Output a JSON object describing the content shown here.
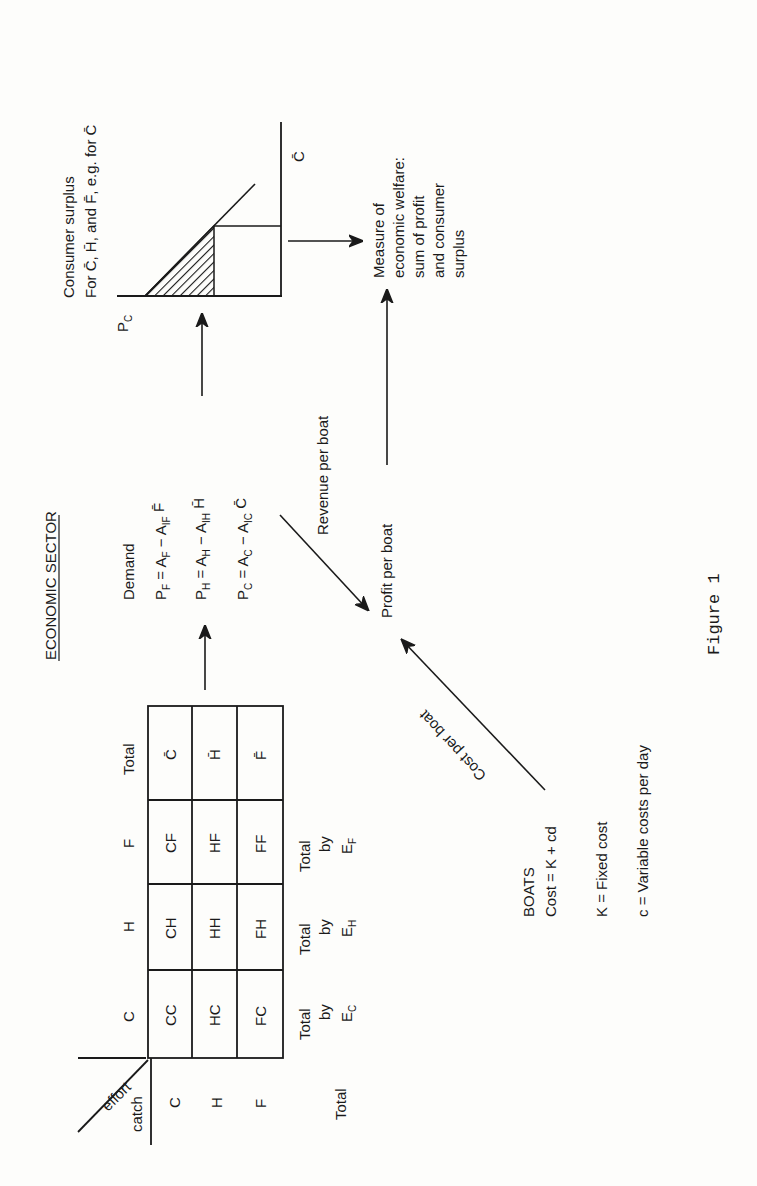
{
  "title": "ECONOMIC SECTOR",
  "figure_caption": "Figure 1",
  "matrix": {
    "corner_top": "effort",
    "corner_bottom": "catch",
    "column_headers": [
      "C",
      "H",
      "F",
      "Total"
    ],
    "row_headers": [
      "C",
      "H",
      "F"
    ],
    "cells": [
      [
        "CC",
        "CH",
        "CF",
        "C̄"
      ],
      [
        "HC",
        "HH",
        "HF",
        "H̄"
      ],
      [
        "FC",
        "FH",
        "FF",
        "F̄"
      ]
    ],
    "total_row_label": "Total",
    "effort_totals": [
      {
        "line1": "Total",
        "line2": "by",
        "sym": "E",
        "sub": "C"
      },
      {
        "line1": "Total",
        "line2": "by",
        "sym": "E",
        "sub": "H"
      },
      {
        "line1": "Total",
        "line2": "by",
        "sym": "E",
        "sub": "F"
      }
    ]
  },
  "demand": {
    "heading": "Demand",
    "equations": [
      {
        "lhs": "P",
        "lhs_sub": "F",
        "a": "A",
        "a_sub": "F",
        "b": "A",
        "b_sub": "IF",
        "var": "F̄"
      },
      {
        "lhs": "P",
        "lhs_sub": "H",
        "a": "A",
        "a_sub": "H",
        "b": "A",
        "b_sub": "IH",
        "var": "H̄"
      },
      {
        "lhs": "P",
        "lhs_sub": "C",
        "a": "A",
        "a_sub": "C",
        "b": "A",
        "b_sub": "IC",
        "var": "C̄"
      }
    ]
  },
  "consumer_surplus": {
    "line1": "Consumer surplus",
    "line2": "For C̄, H̄, and F̄, e.g. for C̄",
    "axis_price": "P",
    "axis_price_sub": "C",
    "axis_quantity": "C̄"
  },
  "welfare": {
    "lines": [
      "Measure of",
      "economic welfare:",
      "sum of profit",
      "and consumer",
      "surplus"
    ]
  },
  "flows": {
    "revenue": "Revenue per boat",
    "profit": "Profit per boat",
    "cost": "Cost per boat"
  },
  "boats": {
    "heading": "BOATS",
    "formula": "Cost = K + cd",
    "k_def": "K = Fixed cost",
    "c_def": "c = Variable costs per day"
  }
}
